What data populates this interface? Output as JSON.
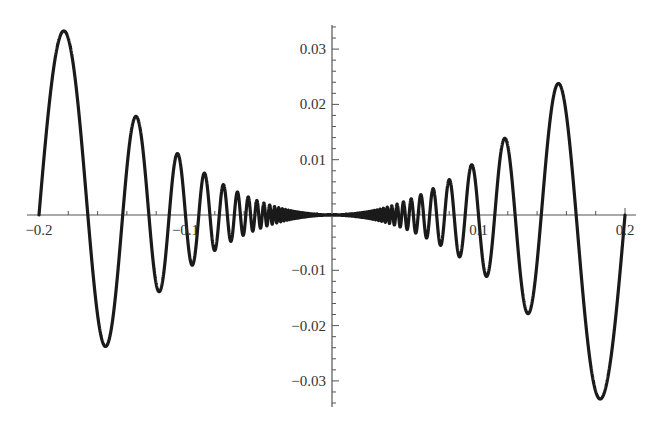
{
  "chart_data": {
    "type": "line",
    "title": "",
    "xlabel": "",
    "ylabel": "",
    "function": "x^2 * sin(pi / x)",
    "xlim": [
      -0.2,
      0.2
    ],
    "ylim": [
      -0.035,
      0.035
    ],
    "grid": false,
    "legend": null,
    "x_ticks": [
      {
        "value": -0.2,
        "label": "−0.2"
      },
      {
        "value": -0.1,
        "label": "−0.1"
      },
      {
        "value": 0.1,
        "label": "0.1"
      },
      {
        "value": 0.2,
        "label": "0.2"
      }
    ],
    "y_ticks": [
      {
        "value": 0.03,
        "label": "0.03"
      },
      {
        "value": 0.02,
        "label": "0.02"
      },
      {
        "value": 0.01,
        "label": "0.01"
      },
      {
        "value": -0.01,
        "label": "−0.01"
      },
      {
        "value": -0.02,
        "label": "−0.02"
      },
      {
        "value": -0.03,
        "label": "−0.03"
      }
    ],
    "series": [
      {
        "name": "f(x) = x² sin(π/x)",
        "color": "#1a1a1a",
        "key_points": [
          {
            "x": -0.2,
            "y": 0.0
          },
          {
            "x": -0.182,
            "y": 0.033
          },
          {
            "x": -0.1667,
            "y": 0.0
          },
          {
            "x": -0.154,
            "y": -0.0237
          },
          {
            "x": -0.1429,
            "y": 0.0
          },
          {
            "x": -0.133,
            "y": 0.0177
          },
          {
            "x": -0.125,
            "y": 0.0
          },
          {
            "x": -0.118,
            "y": -0.0139
          },
          {
            "x": -0.1111,
            "y": 0.0
          },
          {
            "x": -0.105,
            "y": 0.011
          },
          {
            "x": -0.1,
            "y": 0.0
          },
          {
            "x": 0.0,
            "y": 0.0
          },
          {
            "x": 0.1,
            "y": 0.0
          },
          {
            "x": 0.105,
            "y": -0.011
          },
          {
            "x": 0.1111,
            "y": 0.0
          },
          {
            "x": 0.118,
            "y": 0.0139
          },
          {
            "x": 0.125,
            "y": 0.0
          },
          {
            "x": 0.133,
            "y": -0.0177
          },
          {
            "x": 0.1429,
            "y": 0.0
          },
          {
            "x": 0.154,
            "y": 0.0237
          },
          {
            "x": 0.1667,
            "y": 0.0
          },
          {
            "x": 0.182,
            "y": -0.033
          },
          {
            "x": 0.2,
            "y": 0.0
          }
        ]
      }
    ]
  },
  "layout": {
    "origin_px": [
      332,
      215
    ],
    "x_px_per_unit": 1465,
    "y_px_per_unit": 5530,
    "x_axis_px": [
      27,
      636
    ],
    "y_axis_px": [
      25,
      407
    ],
    "x_minor_step": 0.02,
    "y_minor_step": 0.002
  }
}
